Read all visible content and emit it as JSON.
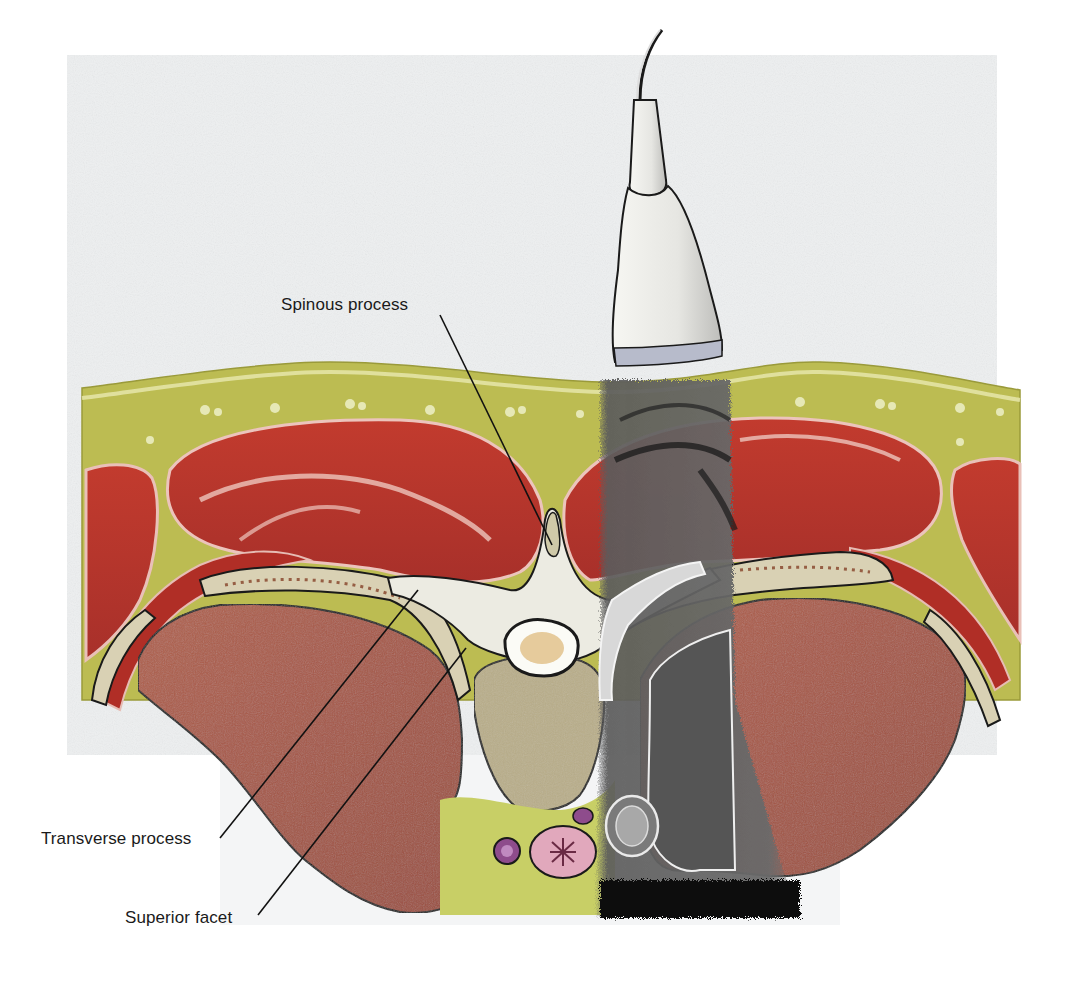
{
  "figure": {
    "colors": {
      "page_background": "#ffffff",
      "backdrop": "#eef0f1",
      "subcutaneous_fat": "#b8b84e",
      "fat_light": "#cfcf7a",
      "muscle": "#b8342a",
      "muscle_fascia": "#e8b8b0",
      "lung": "#a85a48",
      "bone": "#e8e6dc",
      "vertebral_body": "#b8ad88",
      "rib": "#d8d0b4",
      "marrow_speckle": "#8a4a30",
      "spinal_cord": "#e0c090",
      "esophagus": "#d89aae",
      "vessel": "#8a4a88",
      "ultrasound_gray": "#6e6e6e",
      "ultrasound_dark": "#111111",
      "probe_body": "#f2f2ee",
      "probe_footprint": "#b8bccc",
      "outline": "#1a1a1a"
    },
    "labels": [
      {
        "id": "spinous-process",
        "text": "Spinous process"
      },
      {
        "id": "transverse-process",
        "text": "Transverse process"
      },
      {
        "id": "superior-facet",
        "text": "Superior facet"
      }
    ]
  }
}
